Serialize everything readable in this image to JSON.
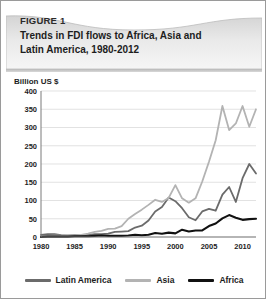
{
  "figure": {
    "label": "FIGURE 1",
    "title_line1": "Trends in FDI flows to Africa, Asia and",
    "title_line2": "Latin America, 1980-2012"
  },
  "colors": {
    "latin_america": "#6b6b6b",
    "asia": "#b3b3b3",
    "africa": "#111111",
    "gridline": "#d5d5d5",
    "axis": "#7a7a7a",
    "header_top": "#d7d7d7",
    "header_bottom": "#f2f2f2",
    "card_border": "#9a9a9a"
  },
  "legend": {
    "position": "bottom",
    "items": [
      {
        "label": "Latin America",
        "color": "#6b6b6b"
      },
      {
        "label": "Asia",
        "color": "#b3b3b3"
      },
      {
        "label": "Africa",
        "color": "#111111"
      }
    ]
  },
  "chart_data": {
    "type": "line",
    "title": "Trends in FDI flows to Africa, Asia and Latin America, 1980-2012",
    "xlabel": "",
    "ylabel": "Billion US $",
    "ylim": [
      0,
      400
    ],
    "xlim": [
      1980,
      2012
    ],
    "grid": true,
    "ytick_labels": [
      "0",
      "50",
      "100",
      "150",
      "200",
      "250",
      "300",
      "350",
      "400"
    ],
    "yticks": [
      0,
      50,
      100,
      150,
      200,
      250,
      300,
      350,
      400
    ],
    "xtick_labels": [
      "1980",
      "1985",
      "1990",
      "1995",
      "2000",
      "2005",
      "2010"
    ],
    "xticks": [
      1980,
      1985,
      1990,
      1995,
      2000,
      2005,
      2010
    ],
    "x": [
      1980,
      1981,
      1982,
      1983,
      1984,
      1985,
      1986,
      1987,
      1988,
      1989,
      1990,
      1991,
      1992,
      1993,
      1994,
      1995,
      1996,
      1997,
      1998,
      1999,
      2000,
      2001,
      2002,
      2003,
      2004,
      2005,
      2006,
      2007,
      2008,
      2009,
      2010,
      2011,
      2012
    ],
    "series": [
      {
        "name": "Latin America",
        "color": "#6b6b6b",
        "values": [
          6,
          8,
          8,
          5,
          4,
          6,
          4,
          6,
          8,
          8,
          9,
          14,
          15,
          16,
          26,
          31,
          45,
          70,
          82,
          108,
          98,
          79,
          54,
          46,
          70,
          77,
          72,
          116,
          137,
          96,
          161,
          200,
          174
        ]
      },
      {
        "name": "Asia",
        "color": "#b3b3b3",
        "values": [
          2,
          3,
          4,
          4,
          5,
          5,
          6,
          9,
          14,
          17,
          22,
          23,
          30,
          50,
          63,
          75,
          88,
          102,
          96,
          107,
          142,
          106,
          94,
          106,
          152,
          206,
          265,
          359,
          293,
          311,
          359,
          302,
          350
        ]
      },
      {
        "name": "Africa",
        "color": "#111111",
        "values": [
          0.4,
          1,
          1,
          1,
          1,
          2,
          2,
          2,
          3,
          4,
          3,
          3,
          3,
          4,
          6,
          5,
          6,
          11,
          9,
          12,
          10,
          20,
          15,
          18,
          18,
          30,
          37,
          51,
          60,
          53,
          47,
          49,
          50
        ]
      }
    ]
  }
}
